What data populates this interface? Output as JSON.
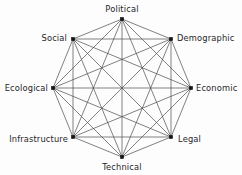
{
  "diagram": {
    "type": "complete-graph",
    "background_color": "#fdfdfd",
    "edge_color": "#4a4a4a",
    "node_color": "#141414",
    "label_color": "#26262a",
    "node_count": 8,
    "edge_count": 28,
    "center": {
      "x": 122,
      "y": 88
    },
    "radius": 69,
    "nodes": [
      {
        "id": "political",
        "label": "Political",
        "x": 122,
        "y": 19,
        "label_x": 122,
        "label_y": 9,
        "anchor": "mid"
      },
      {
        "id": "demographic",
        "label": "Demographic",
        "x": 171,
        "y": 39,
        "label_x": 177,
        "label_y": 38,
        "anchor": "start"
      },
      {
        "id": "economic",
        "label": "Economic",
        "x": 191,
        "y": 88,
        "label_x": 196,
        "label_y": 88,
        "anchor": "start"
      },
      {
        "id": "legal",
        "label": "Legal",
        "x": 171,
        "y": 137,
        "label_x": 178,
        "label_y": 139,
        "anchor": "start"
      },
      {
        "id": "technical",
        "label": "Technical",
        "x": 122,
        "y": 157,
        "label_x": 122,
        "label_y": 167,
        "anchor": "mid"
      },
      {
        "id": "infrastructure",
        "label": "Infrastructure",
        "x": 73,
        "y": 137,
        "label_x": 68,
        "label_y": 139,
        "anchor": "end"
      },
      {
        "id": "ecological",
        "label": "Ecological",
        "x": 53,
        "y": 88,
        "label_x": 48,
        "label_y": 88,
        "anchor": "end"
      },
      {
        "id": "social",
        "label": "Social",
        "x": 73,
        "y": 39,
        "label_x": 67,
        "label_y": 38,
        "anchor": "end"
      }
    ],
    "edges": [
      [
        "political",
        "demographic"
      ],
      [
        "political",
        "economic"
      ],
      [
        "political",
        "legal"
      ],
      [
        "political",
        "technical"
      ],
      [
        "political",
        "infrastructure"
      ],
      [
        "political",
        "ecological"
      ],
      [
        "political",
        "social"
      ],
      [
        "demographic",
        "economic"
      ],
      [
        "demographic",
        "legal"
      ],
      [
        "demographic",
        "technical"
      ],
      [
        "demographic",
        "infrastructure"
      ],
      [
        "demographic",
        "ecological"
      ],
      [
        "demographic",
        "social"
      ],
      [
        "economic",
        "legal"
      ],
      [
        "economic",
        "technical"
      ],
      [
        "economic",
        "infrastructure"
      ],
      [
        "economic",
        "ecological"
      ],
      [
        "economic",
        "social"
      ],
      [
        "legal",
        "technical"
      ],
      [
        "legal",
        "infrastructure"
      ],
      [
        "legal",
        "ecological"
      ],
      [
        "legal",
        "social"
      ],
      [
        "technical",
        "infrastructure"
      ],
      [
        "technical",
        "ecological"
      ],
      [
        "technical",
        "social"
      ],
      [
        "infrastructure",
        "ecological"
      ],
      [
        "infrastructure",
        "social"
      ],
      [
        "ecological",
        "social"
      ]
    ]
  }
}
